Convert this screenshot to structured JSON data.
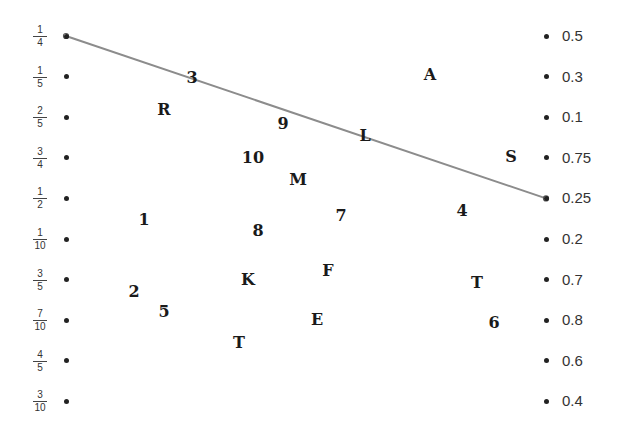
{
  "worksheet": {
    "left_column": [
      {
        "num": "1",
        "den": "4"
      },
      {
        "num": "1",
        "den": "5"
      },
      {
        "num": "2",
        "den": "5"
      },
      {
        "num": "3",
        "den": "4"
      },
      {
        "num": "1",
        "den": "2"
      },
      {
        "num": "1",
        "den": "10"
      },
      {
        "num": "3",
        "den": "5"
      },
      {
        "num": "7",
        "den": "10"
      },
      {
        "num": "4",
        "den": "5"
      },
      {
        "num": "3",
        "den": "10"
      }
    ],
    "right_column": [
      "0.5",
      "0.3",
      "0.1",
      "0.75",
      "0.25",
      "0.2",
      "0.7",
      "0.8",
      "0.6",
      "0.4"
    ],
    "matches": [
      {
        "left_index": 0,
        "right_index": 4,
        "color": "#8c8c8c"
      }
    ],
    "scattered_glyphs": [
      {
        "text": "3"
      },
      {
        "text": "A"
      },
      {
        "text": "R"
      },
      {
        "text": "9"
      },
      {
        "text": "L"
      },
      {
        "text": "10"
      },
      {
        "text": "S"
      },
      {
        "text": "M"
      },
      {
        "text": "7"
      },
      {
        "text": "4"
      },
      {
        "text": "1"
      },
      {
        "text": "8"
      },
      {
        "text": "F"
      },
      {
        "text": "K"
      },
      {
        "text": "T"
      },
      {
        "text": "2"
      },
      {
        "text": "5"
      },
      {
        "text": "E"
      },
      {
        "text": "6"
      },
      {
        "text": "T"
      }
    ]
  }
}
